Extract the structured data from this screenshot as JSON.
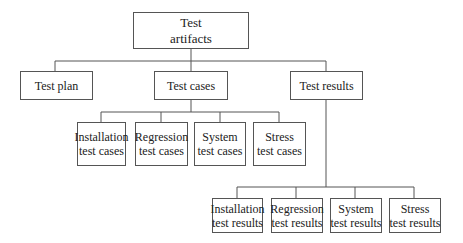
{
  "diagram": {
    "type": "tree",
    "root": {
      "line1": "Test",
      "line2": "artifacts"
    },
    "level1": [
      {
        "label": "Test plan"
      },
      {
        "label": "Test cases"
      },
      {
        "label": "Test results"
      }
    ],
    "test_cases_children": [
      {
        "line1": "Installation",
        "line2": "test cases"
      },
      {
        "line1": "Regression",
        "line2": "test cases"
      },
      {
        "line1": "System",
        "line2": "test cases"
      },
      {
        "line1": "Stress",
        "line2": "test cases"
      }
    ],
    "test_results_children": [
      {
        "line1": "Installation",
        "line2": "test results"
      },
      {
        "line1": "Regression",
        "line2": "test results"
      },
      {
        "line1": "System",
        "line2": "test results"
      },
      {
        "line1": "Stress",
        "line2": "test results"
      }
    ],
    "colors": {
      "line": "#555555",
      "text": "#222222",
      "background": "#ffffff"
    }
  }
}
